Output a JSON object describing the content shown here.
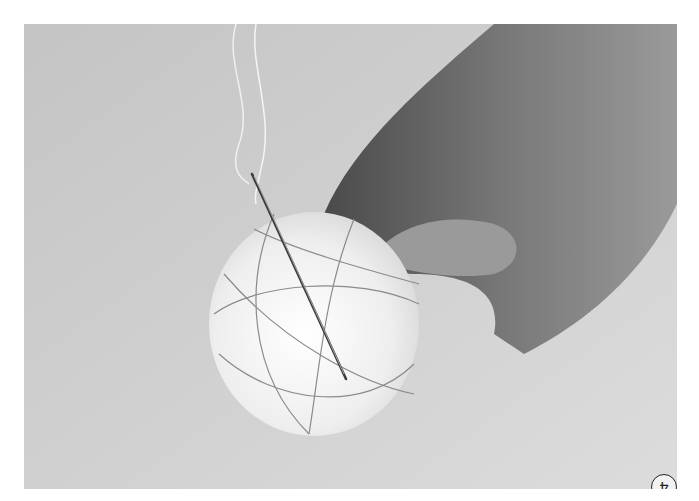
{
  "figure": {
    "step_number": "4",
    "colors": {
      "background": "#cfcfcf",
      "ball": "#f4f4f4",
      "hand": "#6a6a6a",
      "thread": "#8a8a8a"
    }
  }
}
